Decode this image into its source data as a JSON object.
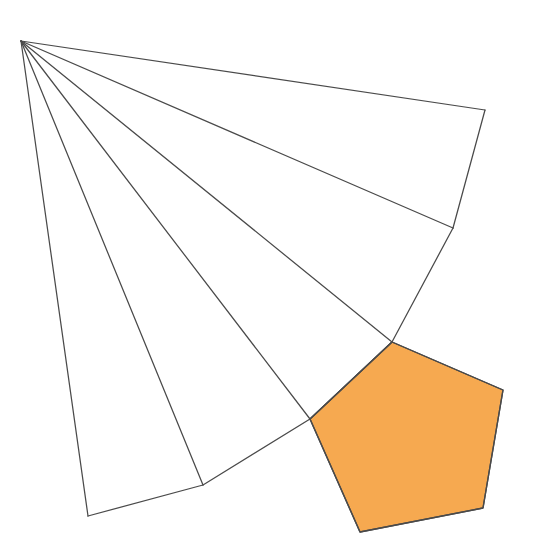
{
  "figure": {
    "title": "Fan of triangular sectors with one highlighted pentagon",
    "canvas": {
      "width": 540,
      "height": 553,
      "background": "#ffffff"
    },
    "style": {
      "line_color": "#4a4a4a",
      "line_width": 1.25,
      "highlight_fill": "#f6a950",
      "highlight_stroke": "#4a4a4a",
      "highlight_stroke_width": 1.35
    },
    "apex": {
      "label": "apex",
      "x": 21,
      "y": 41
    },
    "rays": [
      {
        "name": "ray-1",
        "from": [
          21,
          41
        ],
        "to": [
          485,
          110
        ]
      },
      {
        "name": "ray-2",
        "from": [
          21,
          41
        ],
        "to": [
          453,
          228
        ]
      },
      {
        "name": "ray-3",
        "from": [
          21,
          41
        ],
        "to": [
          392,
          342
        ]
      },
      {
        "name": "ray-4",
        "from": [
          21,
          41
        ],
        "to": [
          310,
          419
        ]
      },
      {
        "name": "ray-5",
        "from": [
          21,
          41
        ],
        "to": [
          203,
          485
        ]
      },
      {
        "name": "ray-6",
        "from": [
          21,
          41
        ],
        "to": [
          88,
          516
        ]
      }
    ],
    "chords": [
      {
        "name": "chord-1",
        "from": [
          485,
          110
        ],
        "to": [
          453,
          228
        ]
      },
      {
        "name": "chord-2",
        "from": [
          453,
          228
        ],
        "to": [
          392,
          342
        ]
      },
      {
        "name": "chord-3",
        "from": [
          392,
          342
        ],
        "to": [
          310,
          419
        ]
      },
      {
        "name": "chord-4",
        "from": [
          310,
          419
        ],
        "to": [
          203,
          485
        ]
      },
      {
        "name": "chord-5",
        "from": [
          203,
          485
        ],
        "to": [
          88,
          516
        ]
      }
    ],
    "highlight_polygon": {
      "name": "orange-pentagon",
      "sides": 5,
      "fill": "#f6a950",
      "points": [
        [
          392,
          342
        ],
        [
          503,
          390
        ],
        [
          483,
          508
        ],
        [
          360,
          532
        ],
        [
          310,
          419
        ]
      ]
    }
  }
}
